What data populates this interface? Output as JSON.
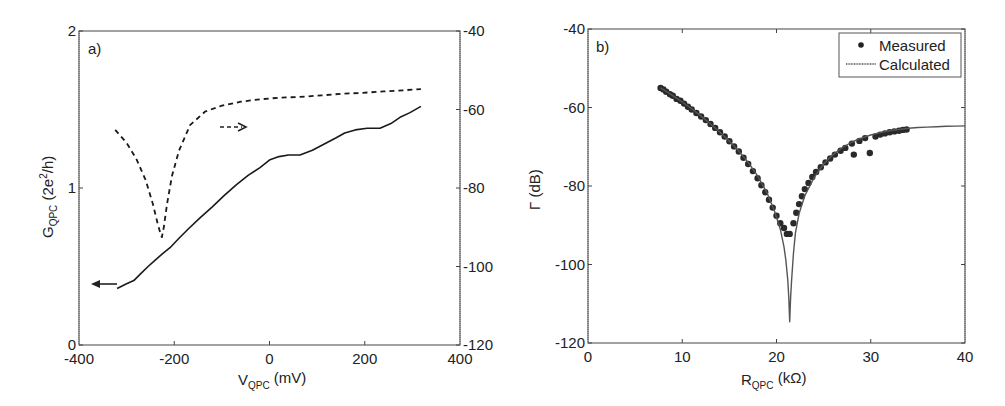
{
  "chart_data": [
    {
      "id": "a",
      "type": "line",
      "panel_label": "a)",
      "xlabel": {
        "main": "V",
        "sub": "QPC",
        "unit": " (mV)"
      },
      "ylabel_left": {
        "main": "G",
        "sub": "QPC",
        "unit": " (2e",
        "sup": "2",
        "unit_end": "/h)"
      },
      "xlim": [
        -400,
        400
      ],
      "ylim_left": [
        0,
        2
      ],
      "ylim_right": [
        -120,
        -40
      ],
      "x_ticks": [
        "-400",
        "-200",
        "0",
        "200",
        "400"
      ],
      "x_tick_values": [
        -400,
        -200,
        0,
        200,
        400
      ],
      "y_left_ticks": [
        "0",
        "1",
        "2"
      ],
      "y_left_tick_values": [
        0,
        1,
        2
      ],
      "y_right_ticks": [
        "-40",
        "-60",
        "-80",
        "-100",
        "-120"
      ],
      "y_right_tick_values": [
        -40,
        -60,
        -80,
        -100,
        -120
      ],
      "grid": false,
      "series": [
        {
          "name": "G_QPC (conductance)",
          "axis": "left",
          "style": "solid",
          "x": [
            -320,
            -300,
            -285,
            -272,
            -255,
            -240,
            -225,
            -209,
            -190,
            -170,
            -146,
            -120,
            -96,
            -70,
            -45,
            -20,
            1,
            20,
            40,
            64,
            90,
            115,
            140,
            158,
            180,
            205,
            232,
            255,
            274,
            295,
            318
          ],
          "y": [
            0.36,
            0.39,
            0.41,
            0.45,
            0.5,
            0.54,
            0.58,
            0.62,
            0.68,
            0.74,
            0.81,
            0.88,
            0.95,
            1.02,
            1.08,
            1.13,
            1.18,
            1.2,
            1.21,
            1.21,
            1.24,
            1.28,
            1.32,
            1.35,
            1.37,
            1.38,
            1.38,
            1.41,
            1.45,
            1.48,
            1.52
          ]
        },
        {
          "name": "Γ (reflection, dB)",
          "axis": "right",
          "style": "dashed",
          "x": [
            -324,
            -300,
            -280,
            -260,
            -245,
            -235,
            -228,
            -226,
            -222,
            -215,
            -205,
            -190,
            -167,
            -135,
            -100,
            -60,
            -20,
            20,
            64,
            110,
            150,
            190,
            240,
            280,
            318
          ],
          "y": [
            -65.2,
            -68.5,
            -72.5,
            -78.0,
            -84.0,
            -89.0,
            -92.0,
            -92.5,
            -90.0,
            -84.0,
            -77.0,
            -70.5,
            -64.0,
            -60.5,
            -59.0,
            -58.0,
            -57.4,
            -57.0,
            -56.8,
            -56.4,
            -56.0,
            -55.8,
            -55.4,
            -55.1,
            -54.8
          ]
        }
      ],
      "annotations": [
        {
          "type": "arrow",
          "direction": "left",
          "meaning": "solid curve → left axis"
        },
        {
          "type": "arrow",
          "direction": "right",
          "style": "dashed",
          "meaning": "dashed curve → right axis"
        }
      ]
    },
    {
      "id": "b",
      "type": "scatter",
      "panel_label": "b)",
      "xlabel": {
        "main": "R",
        "sub": "QPC",
        "unit": " (kΩ)"
      },
      "ylabel": {
        "main": "Γ",
        "unit": " (dB)"
      },
      "xlim": [
        0,
        40
      ],
      "ylim": [
        -120,
        -40
      ],
      "x_ticks": [
        "0",
        "10",
        "20",
        "30",
        "40"
      ],
      "x_tick_values": [
        0,
        10,
        20,
        30,
        40
      ],
      "y_ticks": [
        "-40",
        "-60",
        "-80",
        "-100",
        "-120"
      ],
      "y_tick_values": [
        -40,
        -60,
        -80,
        -100,
        -120
      ],
      "grid": false,
      "legend": {
        "position": "top-right",
        "entries": [
          {
            "label": "Measured",
            "marker": "dot"
          },
          {
            "label": "Calculated",
            "marker": "line"
          }
        ]
      },
      "series": [
        {
          "name": "Measured",
          "style": "markers",
          "x": [
            7.7,
            8.0,
            8.3,
            8.7,
            9.0,
            9.4,
            9.8,
            10.2,
            10.6,
            11.0,
            11.5,
            12.0,
            12.5,
            13.0,
            13.5,
            14.0,
            14.5,
            15.0,
            15.5,
            16.0,
            16.5,
            17.0,
            17.5,
            18.0,
            18.4,
            18.8,
            19.2,
            19.6,
            20.0,
            20.4,
            20.8,
            21.1,
            21.4,
            21.8,
            22.1,
            22.4,
            22.7,
            23.0,
            23.4,
            23.8,
            24.2,
            24.7,
            25.2,
            25.7,
            26.2,
            26.8,
            27.3,
            28.0,
            28.2,
            28.8,
            29.4,
            29.9,
            30.5,
            31.0,
            31.5,
            32.0,
            32.5,
            33.0,
            33.4,
            33.8
          ],
          "y": [
            -55.0,
            -55.4,
            -56.0,
            -56.6,
            -57.0,
            -57.8,
            -58.3,
            -59.0,
            -59.8,
            -60.5,
            -61.4,
            -62.3,
            -63.2,
            -64.2,
            -65.2,
            -66.3,
            -67.4,
            -68.6,
            -69.9,
            -71.2,
            -72.8,
            -74.4,
            -76.2,
            -78.0,
            -79.8,
            -81.6,
            -83.5,
            -85.5,
            -87.6,
            -89.5,
            -90.7,
            -92.2,
            -92.2,
            -89.5,
            -86.8,
            -84.6,
            -82.6,
            -80.8,
            -79.2,
            -77.7,
            -76.4,
            -75.2,
            -74.0,
            -73.0,
            -72.0,
            -71.0,
            -70.3,
            -69.2,
            -72.0,
            -68.5,
            -67.8,
            -71.6,
            -67.4,
            -66.9,
            -66.6,
            -66.3,
            -66.1,
            -65.9,
            -65.7,
            -65.6
          ]
        },
        {
          "name": "Calculated",
          "style": "line",
          "x": [
            7.7,
            9,
            10,
            11,
            12,
            13,
            14,
            15,
            16,
            17,
            18,
            19,
            19.8,
            20.4,
            20.8,
            21.0,
            21.2,
            21.3,
            21.4,
            21.5,
            21.6,
            21.8,
            22.0,
            22.4,
            23.0,
            24,
            25,
            26,
            27,
            28,
            29,
            30,
            31,
            32,
            33,
            34,
            35,
            36,
            37,
            38,
            39,
            40
          ],
          "y": [
            -55.0,
            -57.0,
            -58.6,
            -60.3,
            -62.2,
            -64.2,
            -66.3,
            -68.6,
            -71.1,
            -74.0,
            -77.4,
            -81.8,
            -86.5,
            -91.0,
            -95.5,
            -99.0,
            -104.0,
            -108.5,
            -114.6,
            -108.5,
            -104.0,
            -97.0,
            -92.0,
            -87.0,
            -82.5,
            -77.8,
            -74.4,
            -72.0,
            -70.2,
            -68.8,
            -67.8,
            -67.0,
            -66.4,
            -65.9,
            -65.6,
            -65.3,
            -65.1,
            -65.0,
            -64.9,
            -64.8,
            -64.75,
            -64.7
          ]
        }
      ]
    }
  ]
}
